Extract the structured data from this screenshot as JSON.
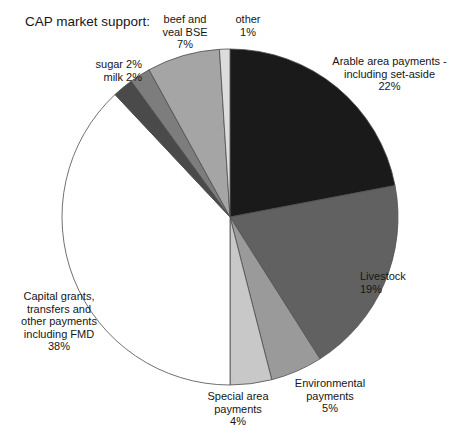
{
  "chart_title": "CAP market support:",
  "chart_data": {
    "type": "pie",
    "title": "CAP market support:",
    "xlabel": "",
    "ylabel": "",
    "legend_position": "none",
    "grid": false,
    "units": "percent",
    "total": 100,
    "start_angle_deg": 0,
    "direction": "clockwise",
    "categories": [
      "Arable area payments - including set-aside",
      "Livestock",
      "Environmental payments",
      "Special area payments",
      "Capital grants, transfers and other payments including FMD",
      "milk",
      "sugar",
      "beef and veal BSE",
      "other"
    ],
    "values": [
      22,
      19,
      5,
      4,
      38,
      2,
      2,
      7,
      1
    ],
    "colors": [
      "#1a1a1a",
      "#616161",
      "#9a9a9a",
      "#c8c8c8",
      "#ffffff",
      "#4a4a4a",
      "#7d7d7d",
      "#a5a5a5",
      "#dcdcdc"
    ],
    "slices": [
      {
        "name": "arable",
        "label": "Arable area payments -\ninclude-set-aside",
        "value": 22,
        "color": "#1a1a1a"
      },
      {
        "name": "livestock",
        "label": "Livestock",
        "value": 19,
        "color": "#616161"
      },
      {
        "name": "environmental",
        "label": "Environmental payments",
        "value": 5,
        "color": "#9a9a9a"
      },
      {
        "name": "special-area",
        "label": "Special area payments",
        "value": 4,
        "color": "#c8c8c8"
      },
      {
        "name": "capital-grants",
        "label": "Capital grants, transfers and other payments including FMD",
        "value": 38,
        "color": "#ffffff"
      },
      {
        "name": "milk",
        "label": "milk",
        "value": 2,
        "color": "#4a4a4a"
      },
      {
        "name": "sugar",
        "label": "sugar",
        "value": 2,
        "color": "#7d7d7d"
      },
      {
        "name": "beef-veal-bse",
        "label": "beef and veal BSE",
        "value": 7,
        "color": "#a5a5a5"
      },
      {
        "name": "other",
        "label": "other",
        "value": 1,
        "color": "#dcdcdc"
      }
    ]
  },
  "labels": {
    "beef": "beef and\nveal BSE\n7%",
    "other": "other\n1%",
    "sugar": "sugar 2%",
    "milk": "milk 2%",
    "arable": "Arable area payments -\nincluding set-aside\n22%",
    "livestock": "Livestock\n19%",
    "capital": "Capital grants,\ntransfers and\nother payments\nincluding FMD\n38%",
    "special": "Special area\npayments\n4%",
    "environmental": "Environmental\npayments\n5%"
  }
}
